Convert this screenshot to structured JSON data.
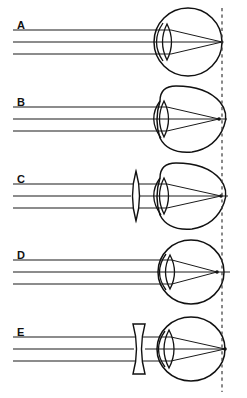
{
  "figure": {
    "width": 247,
    "height": 398,
    "background_color": "#ffffff",
    "ink_color": "#111111",
    "retina_reference_line": {
      "name": "normal-focal-plane",
      "style": "vertical dashed line",
      "x": 222,
      "y_top": 8,
      "y_bottom": 392,
      "color": "#3a3a3a"
    },
    "ray_count_per_panel": 3,
    "ray_start_x": 13,
    "panels": [
      {
        "id": "A",
        "label": "A",
        "label_x": 17,
        "label_y": 29,
        "axis_y": 42,
        "eye": {
          "shape": "circle",
          "center_x": 188,
          "center_y": 42,
          "radius_x": 34,
          "radius_y": 34
        },
        "corrective_lens": "none",
        "focus_x": 222,
        "focus_on_retina": true,
        "condition": "emmetropia-normal"
      },
      {
        "id": "B",
        "label": "B",
        "label_x": 17,
        "label_y": 106,
        "axis_y": 119,
        "eye": {
          "shape": "ellipse-elongated",
          "center_x": 186,
          "center_y": 119,
          "radius_x": 38,
          "radius_y": 33
        },
        "corrective_lens": "none",
        "focus_x": 219,
        "focus_on_retina": false,
        "condition": "myopia-uncorrected"
      },
      {
        "id": "C",
        "label": "C",
        "label_x": 17,
        "label_y": 183,
        "axis_y": 196,
        "eye": {
          "shape": "ellipse-elongated",
          "center_x": 186,
          "center_y": 196,
          "radius_x": 38,
          "radius_y": 33
        },
        "corrective_lens": "biconvex",
        "spectacle_lens": {
          "center_x": 136,
          "center_y": 196,
          "half_height": 25,
          "half_width": 5
        },
        "focus_x": 221,
        "focus_on_retina": true,
        "condition": "myopia-corrected-convex-lens"
      },
      {
        "id": "D",
        "label": "D",
        "label_x": 17,
        "label_y": 259,
        "axis_y": 272,
        "eye": {
          "shape": "ellipse-shortened",
          "center_x": 191,
          "center_y": 272,
          "radius_x": 33,
          "radius_y": 32
        },
        "corrective_lens": "none",
        "focus_x": 217,
        "focus_on_retina": false,
        "condition": "hyperopia-uncorrected"
      },
      {
        "id": "E",
        "label": "E",
        "label_x": 17,
        "label_y": 336,
        "axis_y": 349,
        "eye": {
          "shape": "ellipse-shortened",
          "center_x": 191,
          "center_y": 349,
          "radius_x": 34,
          "radius_y": 32
        },
        "corrective_lens": "biconcave",
        "spectacle_lens": {
          "center_x": 139,
          "center_y": 349,
          "half_height": 25,
          "half_width": 6
        },
        "focus_x": 225,
        "focus_on_retina": true,
        "condition": "hyperopia-corrected-concave-lens"
      }
    ]
  }
}
